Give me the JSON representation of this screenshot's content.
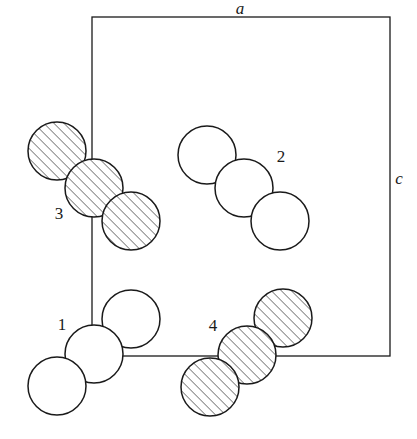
{
  "figure": {
    "type": "crystal-structure-projection",
    "width": 417,
    "height": 439,
    "background_color": "#ffffff",
    "line_color": "#1a1a1a"
  },
  "unit_cell": {
    "name": "unit-cell-box",
    "x": 92,
    "y": 17,
    "width": 298,
    "height": 339,
    "stroke_width": 1.3
  },
  "axes": [
    {
      "label": "a",
      "name": "axis-label-a",
      "x": 240,
      "y": 14,
      "anchor": "middle",
      "orientation": "horizontal-top"
    },
    {
      "label": "c",
      "name": "axis-label-c",
      "x": 399,
      "y": 184,
      "anchor": "middle",
      "orientation": "vertical-right"
    }
  ],
  "atom_radius": 29,
  "groups": [
    {
      "id": "1",
      "label": "1",
      "fill_style": "open",
      "label_x": 62,
      "label_y": 330,
      "atoms": [
        {
          "cx": 131,
          "cy": 319,
          "r": 29
        },
        {
          "cx": 94,
          "cy": 354,
          "r": 29
        },
        {
          "cx": 57,
          "cy": 386,
          "r": 29
        }
      ]
    },
    {
      "id": "2",
      "label": "2",
      "fill_style": "open",
      "label_x": 281,
      "label_y": 162,
      "atoms": [
        {
          "cx": 207,
          "cy": 155,
          "r": 29
        },
        {
          "cx": 244,
          "cy": 188,
          "r": 29
        },
        {
          "cx": 280,
          "cy": 221,
          "r": 29
        }
      ]
    },
    {
      "id": "3",
      "label": "3",
      "fill_style": "hatched",
      "label_x": 59,
      "label_y": 219,
      "atoms": [
        {
          "cx": 57,
          "cy": 151,
          "r": 29
        },
        {
          "cx": 94,
          "cy": 188,
          "r": 29
        },
        {
          "cx": 131,
          "cy": 221,
          "r": 29
        }
      ]
    },
    {
      "id": "4",
      "label": "4",
      "fill_style": "hatched",
      "label_x": 213,
      "label_y": 331,
      "atoms": [
        {
          "cx": 283,
          "cy": 318,
          "r": 29
        },
        {
          "cx": 247,
          "cy": 355,
          "r": 29
        },
        {
          "cx": 210,
          "cy": 387,
          "r": 29
        }
      ]
    }
  ],
  "hatch": {
    "angle_deg": 45,
    "spacing": 5,
    "stroke_width": 1,
    "color": "#1a1a1a"
  },
  "draw_order": [
    "group-3",
    "group-2",
    "group-1",
    "group-4"
  ]
}
